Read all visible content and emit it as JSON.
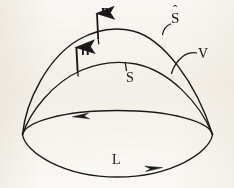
{
  "figure": {
    "kind": "hand-drawn-vector-calculus-diagram",
    "background_color": "#faf8f4",
    "stroke_color": "#1a1a1a",
    "width": 234,
    "height": 188,
    "labels": {
      "n_hat": "n",
      "n_hat_accent": "ˆ",
      "n_bold": "n",
      "s_hat": "S",
      "s_hat_accent": "ˆ",
      "s_plain": "S",
      "volume": "V",
      "loop": "L"
    },
    "annotations": {
      "n_hat_full": "n̂",
      "s_hat_full": "Ŝ"
    },
    "elements": [
      {
        "name": "outer-surface-curve",
        "label": "Ŝ",
        "role": "outer cap boundary"
      },
      {
        "name": "inner-surface-curve",
        "label": "S",
        "role": "inner cap boundary"
      },
      {
        "name": "boundary-loop-ellipse",
        "label": "L",
        "role": "closed boundary curve with circulation arrows"
      },
      {
        "name": "outer-normal-vector",
        "label": "n̂",
        "role": "unit normal on outer surface"
      },
      {
        "name": "inner-normal-vector",
        "label": "n",
        "role": "normal vector on inner surface"
      },
      {
        "name": "volume-region",
        "label": "V",
        "role": "region between the two surfaces"
      }
    ]
  }
}
